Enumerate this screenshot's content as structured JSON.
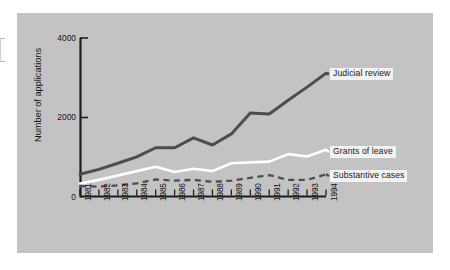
{
  "chart_data": {
    "type": "line",
    "title": "",
    "xlabel": "",
    "ylabel": "Number of applications",
    "categories": [
      "1981",
      "1982",
      "1983",
      "1984",
      "1985",
      "1986",
      "1987",
      "1988",
      "1989",
      "1990",
      "1991",
      "1992",
      "1993",
      "1994"
    ],
    "ylim": [
      0,
      4000
    ],
    "yticks": [
      0,
      2000,
      4000
    ],
    "ytick_labels": [
      "0",
      "2000",
      "4000"
    ],
    "grid": false,
    "legend_position": "right-inline-labels",
    "series": [
      {
        "name": "Judicial review",
        "style": "solid",
        "color": "#4d4d4d",
        "values": [
          560,
          685,
          840,
          1000,
          1230,
          1230,
          1480,
          1300,
          1580,
          2110,
          2080,
          2430,
          2760,
          3110
        ]
      },
      {
        "name": "Grants of leave",
        "style": "solid",
        "color": "#ffffff",
        "values": [
          330,
          420,
          530,
          640,
          750,
          620,
          700,
          640,
          840,
          860,
          880,
          1070,
          1010,
          1180
        ]
      },
      {
        "name": "Substantive cases",
        "style": "dashed",
        "color": "#4d4d4d",
        "values": [
          260,
          250,
          280,
          330,
          430,
          400,
          420,
          370,
          400,
          470,
          540,
          420,
          420,
          560
        ]
      }
    ]
  },
  "labels": {
    "judicial_review": "Judicial review",
    "grants_of_leave": "Grants of leave",
    "substantive_cases": "Substantive cases",
    "y_axis_title": "Number of applications"
  },
  "axis": {
    "y_ticks": [
      "0",
      "2000",
      "4000"
    ],
    "x_ticks": [
      "1981",
      "1982",
      "1983",
      "1984",
      "1985",
      "1986",
      "1987",
      "1988",
      "1989",
      "1990",
      "1991",
      "1992",
      "1993",
      "1994"
    ]
  },
  "colors": {
    "panel_background": "#c3c3c3",
    "page_background": "#ffffff",
    "axis": "#1c1c1c",
    "judicial_review_line": "#4d4d4d",
    "grants_of_leave_line": "#ffffff",
    "substantive_cases_line": "#4d4d4d",
    "label_background": "#f2f2f2",
    "text": "#161616"
  }
}
